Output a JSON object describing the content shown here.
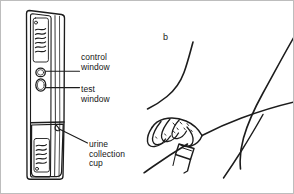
{
  "figure": {
    "panel_letter": "b",
    "background_color": "#ffffff",
    "ink_color": "#1a1a1a",
    "width": 294,
    "height": 194
  },
  "labels": {
    "control_window": "control\nwindow",
    "test_window": "test\nwindow",
    "urine_collection_cup": "urine\ncollection\ncup"
  },
  "diagram": {
    "left_panel_name": "midstream-urine-test-device-with-callouts",
    "right_panel_name": "hand-holding-test-device-between-legs",
    "device_parts": [
      "handle-with-grip-hatching",
      "control-window",
      "test-window",
      "urine-collection-cup"
    ]
  }
}
